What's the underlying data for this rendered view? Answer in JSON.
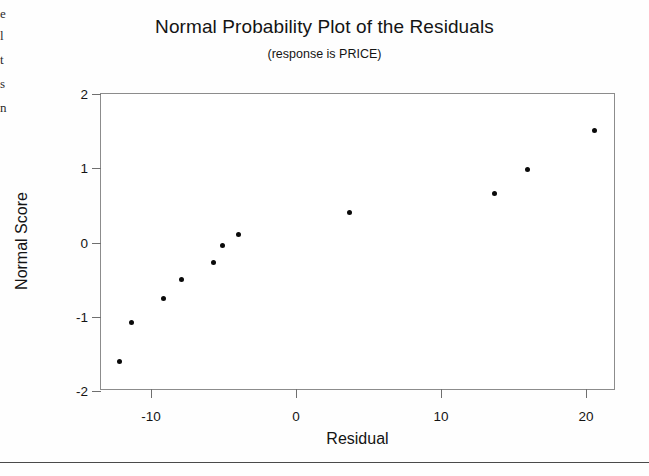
{
  "page": {
    "background_color": "#fefefe",
    "scan_fragments": [
      {
        "text": "e",
        "top": 6
      },
      {
        "text": "l",
        "top": 28
      },
      {
        "text": "t",
        "top": 52
      },
      {
        "text": "s",
        "top": 76
      },
      {
        "text": "n",
        "top": 100
      }
    ],
    "footer_rule_top": 462
  },
  "chart_data": {
    "type": "scatter",
    "title": "Normal Probability Plot of the Residuals",
    "subtitle": "(response is PRICE)",
    "xlabel": "Residual",
    "ylabel": "Normal Score",
    "xlim": [
      -13.45,
      22.07
    ],
    "ylim": [
      -2.0,
      2.0
    ],
    "xticks": [
      -10,
      0,
      10,
      20
    ],
    "xtick_labels": [
      "-10",
      "0",
      "10",
      "20"
    ],
    "yticks": [
      2,
      1,
      0,
      -1,
      -2
    ],
    "ytick_labels": [
      "2",
      "1",
      "0",
      "-1",
      "-2"
    ],
    "grid": false,
    "legend": false,
    "marker_color": "#0a0a0a",
    "frame_color": "#8c8c8c",
    "points": [
      {
        "x": -12.14,
        "y": -1.6
      },
      {
        "x": -11.38,
        "y": -1.08
      },
      {
        "x": -9.17,
        "y": -0.76
      },
      {
        "x": -7.93,
        "y": -0.5
      },
      {
        "x": -5.66,
        "y": -0.27
      },
      {
        "x": -5.1,
        "y": -0.04
      },
      {
        "x": -4.0,
        "y": 0.11
      },
      {
        "x": 3.66,
        "y": 0.41
      },
      {
        "x": 13.66,
        "y": 0.66
      },
      {
        "x": 16.0,
        "y": 0.98
      },
      {
        "x": 20.62,
        "y": 1.51
      }
    ]
  }
}
